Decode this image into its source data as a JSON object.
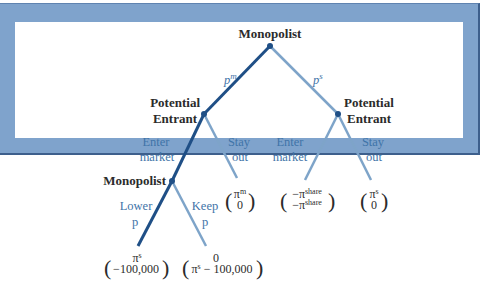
{
  "diagram": {
    "type": "game-tree",
    "colors": {
      "frame": "#7fa3cc",
      "frame_edge": "#3d5f8c",
      "equilibrium_branch": "#1f4f86",
      "other_branch": "#7ea4c9",
      "action_text": "#3f74a8",
      "node_text": "#2b2b2b"
    },
    "nodes": {
      "root": "Monopolist",
      "left_entrant_1": "Potential",
      "left_entrant_2": "Entrant",
      "right_entrant_1": "Potential",
      "right_entrant_2": "Entrant",
      "lower_monopolist": "Monopolist"
    },
    "actions": {
      "pm_base": "p",
      "pm_sup": "m",
      "ps_base": "p",
      "ps_sup": "s",
      "left_enter_1": "Enter",
      "left_enter_2": "market",
      "left_stay_1": "Stay",
      "left_stay_2": "out",
      "right_enter_1": "Enter",
      "right_enter_2": "market",
      "right_stay_1": "Stay",
      "right_stay_2": "out",
      "lower_1": "Lower",
      "lower_2": "p",
      "keep_1": "Keep",
      "keep_2": "p"
    },
    "payoffs": {
      "lower_p": {
        "top": "π",
        "top_sup": "s",
        "bottom": "−100,000"
      },
      "keep_p": {
        "top": "0",
        "bottom_base": "π",
        "bottom_sup": "s",
        "bottom_rest": " − 100,000"
      },
      "left_stay": {
        "top": "π",
        "top_sup": "m",
        "bottom": "0"
      },
      "right_enter": {
        "top": "−π",
        "top_sup": "share",
        "bottom": "−π",
        "bottom_sup": "share"
      },
      "right_stay": {
        "top": "π",
        "top_sup": "s",
        "bottom": "0"
      }
    },
    "paren_open": "(",
    "paren_close": ")"
  }
}
